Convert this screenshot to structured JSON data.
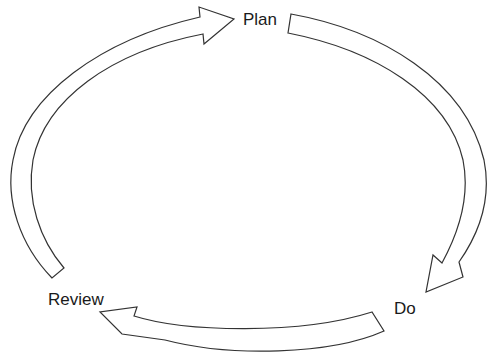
{
  "diagram": {
    "title": "",
    "type": "cycle",
    "nodes": [
      {
        "id": "plan",
        "label": "Plan"
      },
      {
        "id": "do",
        "label": "Do"
      },
      {
        "id": "review",
        "label": "Review"
      }
    ],
    "edges": [
      {
        "from": "plan",
        "to": "do"
      },
      {
        "from": "do",
        "to": "review"
      },
      {
        "from": "review",
        "to": "plan"
      }
    ],
    "colors": {
      "stroke": "#333333",
      "fill": "#ffffff",
      "text": "#1a1a1a"
    }
  }
}
